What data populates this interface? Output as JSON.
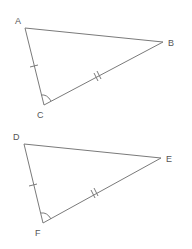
{
  "header": {
    "cut_text": ""
  },
  "triangles": [
    {
      "name": "ABC",
      "vertices": {
        "A": {
          "label": "A",
          "x": 25,
          "y": 28,
          "lx": 15,
          "ly": 24
        },
        "B": {
          "label": "B",
          "x": 163,
          "y": 42,
          "lx": 168,
          "ly": 46
        },
        "C": {
          "label": "C",
          "x": 44,
          "y": 105,
          "lx": 37,
          "ly": 118
        }
      },
      "marks": {
        "AC": "single tick",
        "BC": "double tick",
        "C": "angle arc"
      }
    },
    {
      "name": "DEF",
      "vertices": {
        "D": {
          "label": "D",
          "x": 24,
          "y": 144,
          "lx": 13,
          "ly": 140
        },
        "E": {
          "label": "E",
          "x": 161,
          "y": 158,
          "lx": 166,
          "ly": 162
        },
        "F": {
          "label": "F",
          "x": 43,
          "y": 223,
          "lx": 35,
          "ly": 236
        }
      },
      "marks": {
        "DF": "single tick",
        "EF": "double tick",
        "F": "angle arc"
      }
    }
  ],
  "colors": {
    "line": "#7a7a7a",
    "label": "#555555"
  }
}
